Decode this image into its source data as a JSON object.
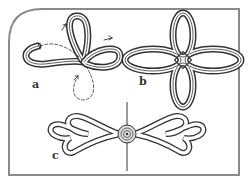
{
  "figure": {
    "panels": [
      {
        "id": "a",
        "label": "a",
        "description": "Knot being formed with loops and direction arrows, dashed path shows cord continuation"
      },
      {
        "id": "b",
        "label": "b",
        "description": "Completed four-loop knot"
      },
      {
        "id": "c",
        "label": "c",
        "description": "Pair of knots fastened with central button on a seam"
      }
    ]
  },
  "colors": {
    "frame": "#8a8a8a",
    "cord_outline": "#333333",
    "cord_fill": "#ffffff",
    "background": "#ffffff"
  }
}
